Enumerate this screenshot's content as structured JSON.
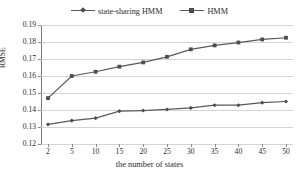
{
  "chart_data": {
    "type": "line",
    "title": "",
    "xlabel": "the number of states",
    "ylabel": "RMSE",
    "x": [
      2,
      5,
      10,
      15,
      20,
      25,
      30,
      35,
      40,
      45,
      50
    ],
    "xtick_labels": [
      "2",
      "5",
      "10",
      "15",
      "20",
      "25",
      "30",
      "35",
      "40",
      "45",
      "50"
    ],
    "ytick_labels": [
      "0.19",
      "0.18",
      "0.17",
      "0.16",
      "0.15",
      "0.14",
      "0.13",
      "0.12"
    ],
    "ytick_values": [
      0.19,
      0.18,
      0.17,
      0.16,
      0.15,
      0.14,
      0.13,
      0.12
    ],
    "ylim": [
      0.12,
      0.19
    ],
    "grid": "horizontal",
    "legend_position": "top-center",
    "series": [
      {
        "name": "state-sharing HMM",
        "marker": "diamond",
        "color": "#595959",
        "values": [
          0.1315,
          0.1338,
          0.1352,
          0.1393,
          0.1397,
          0.1403,
          0.1412,
          0.1428,
          0.1428,
          0.1443,
          0.145
        ]
      },
      {
        "name": "HMM",
        "marker": "square",
        "color": "#595959",
        "values": [
          0.147,
          0.16,
          0.1625,
          0.1655,
          0.168,
          0.1713,
          0.1757,
          0.178,
          0.1797,
          0.1815,
          0.1825
        ]
      }
    ]
  },
  "legend": {
    "entries": [
      {
        "label": "state-sharing HMM"
      },
      {
        "label": "HMM"
      }
    ]
  },
  "colors": {
    "series_line": "#595959",
    "gridline": "#d4d4d4",
    "axis": "#8a8a8a",
    "text": "#2b2b2b",
    "background": "#ffffff"
  }
}
